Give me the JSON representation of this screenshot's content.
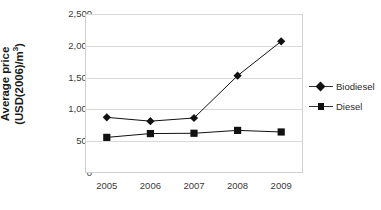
{
  "chart_data": {
    "type": "line",
    "title": "",
    "xlabel": "",
    "ylabel": "Average price (USD(2006)/m3)",
    "ylabel_line1": "Average price",
    "ylabel_line2_pre": "(USD(2006)/m",
    "ylabel_line2_sup": "3",
    "ylabel_line2_post": ")",
    "categories": [
      "2005",
      "2006",
      "2007",
      "2008",
      "2009"
    ],
    "ylim": [
      0,
      2500
    ],
    "yticks": [
      0,
      500,
      1000,
      1500,
      2000,
      2500
    ],
    "ytick_labels": [
      "0",
      "500",
      "1,000",
      "1,500",
      "2,000",
      "2,500"
    ],
    "grid": true,
    "legend_position": "right",
    "series": [
      {
        "name": "Biodiesel",
        "marker": "diamond",
        "color": "#111111",
        "values": [
          875,
          815,
          865,
          1530,
          2070
        ]
      },
      {
        "name": "Diesel",
        "marker": "square",
        "color": "#111111",
        "values": [
          560,
          620,
          625,
          670,
          645
        ]
      }
    ]
  },
  "legend": {
    "items": [
      {
        "label": "Biodiesel",
        "marker": "diamond-marker-icon"
      },
      {
        "label": "Diesel",
        "marker": "square-marker-icon"
      }
    ]
  }
}
